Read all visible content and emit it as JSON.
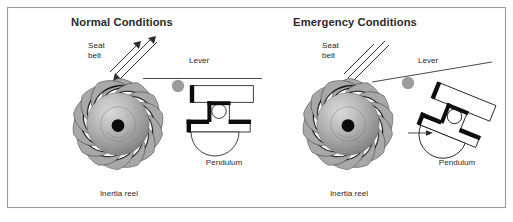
{
  "figure": {
    "width": 513,
    "height": 222,
    "background_color": "#ffffff",
    "frame_color": "#9a9a9a",
    "title_color": "#2a2a2a",
    "label_color": "#2b2b2b",
    "gear_tooth_color": "#a8a8a8",
    "gear_shadow_color": "#111111",
    "lever_dot_color": "#9c9c9c",
    "mechanism_black": "#0d0d0d"
  },
  "panels": [
    {
      "id": "normal",
      "title": "Normal Conditions",
      "labels": {
        "seat_belt_line1": "Seat",
        "seat_belt_line2": "belt",
        "lever": "Lever",
        "pendulum": "Pendulum",
        "inertia_reel": "Inertia reel"
      },
      "state": {
        "pendulum_tilt_degrees": 0,
        "lever_engaged": "false",
        "motion_arrow": "false"
      }
    },
    {
      "id": "emergency",
      "title": "Emergency Conditions",
      "labels": {
        "seat_belt_line1": "Seat",
        "seat_belt_line2": "belt",
        "lever": "Lever",
        "pendulum": "Pendulum",
        "inertia_reel": "Inertia reel"
      },
      "state": {
        "pendulum_tilt_degrees": 22,
        "lever_engaged": "true",
        "motion_arrow": "true"
      }
    }
  ]
}
